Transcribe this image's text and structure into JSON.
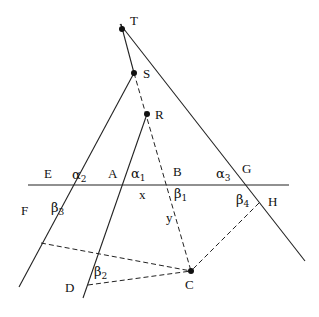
{
  "diagram": {
    "points": {
      "T": {
        "label": "T",
        "x": 122,
        "y": 29
      },
      "S": {
        "label": "S",
        "x": 134,
        "y": 73
      },
      "R": {
        "label": "R",
        "x": 147,
        "y": 114
      },
      "C": {
        "label": "C",
        "x": 191,
        "y": 271
      }
    },
    "labels": {
      "E": "E",
      "A": "A",
      "B": "B",
      "G": "G",
      "F": "F",
      "D": "D",
      "H": "H",
      "x": "x",
      "y": "y"
    },
    "angles": {
      "alpha1": {
        "base": "α",
        "sub": "1"
      },
      "alpha2": {
        "base": "α",
        "sub": "2"
      },
      "alpha3": {
        "base": "α",
        "sub": "3"
      },
      "beta1": {
        "base": "β",
        "sub": "1"
      },
      "beta2": {
        "base": "β",
        "sub": "2"
      },
      "beta3": {
        "base": "β",
        "sub": "3"
      },
      "beta4": {
        "base": "β",
        "sub": "4"
      }
    },
    "colors": {
      "stroke": "#222222",
      "background": "#ffffff"
    }
  }
}
